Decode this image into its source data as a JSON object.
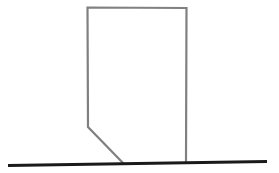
{
  "figure": {
    "title": "Line drawing of a chamfered rectangular block resting on a ground line",
    "canvas": {
      "width": 279,
      "height": 173,
      "background_color": "#ffffff"
    },
    "ground_line": {
      "name": "ground-line",
      "color": "#1a1a1a",
      "stroke_width": 3,
      "x1": 8,
      "y1": 165.5,
      "x2": 267,
      "y2": 161.5,
      "points": "8,165.5 267,161.5"
    },
    "block_outline": {
      "name": "block-outline",
      "color": "#808080",
      "stroke_width": 2.2,
      "fill": "none",
      "vertices": [
        {
          "label": "bottom-right-at-ground",
          "x": 186,
          "y": 163
        },
        {
          "label": "top-right",
          "x": 186.5,
          "y": 8
        },
        {
          "label": "top-left",
          "x": 87.5,
          "y": 7.5
        },
        {
          "label": "left-bend",
          "x": 88,
          "y": 127
        },
        {
          "label": "chamfer-foot-at-ground",
          "x": 123.5,
          "y": 163.5
        }
      ],
      "points": "186,163 186.5,8 87.5,7.5 88,127 123.5,163.5"
    }
  }
}
